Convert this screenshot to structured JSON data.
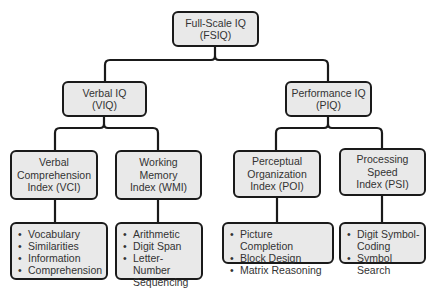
{
  "diagram": {
    "type": "hierarchy",
    "root": {
      "id": "fsiq",
      "label": "Full-Scale IQ\n(FSIQ)"
    },
    "level1": [
      {
        "id": "viq",
        "label": "Verbal IQ\n(VIQ)"
      },
      {
        "id": "piq",
        "label": "Performance IQ\n(PIQ)"
      }
    ],
    "level2": [
      {
        "id": "vci",
        "parent": "viq",
        "label": "Verbal\nComprehension\nIndex (VCI)",
        "subtests": [
          "Vocabulary",
          "Similarities",
          "Information",
          "Comprehension"
        ]
      },
      {
        "id": "wmi",
        "parent": "viq",
        "label": "Working\nMemory\nIndex (WMI)",
        "subtests": [
          "Arithmetic",
          "Digit Span",
          "Letter-Number\nSequencing"
        ]
      },
      {
        "id": "poi",
        "parent": "piq",
        "label": "Perceptual\nOrganization\nIndex (POI)",
        "subtests": [
          "Picture Completion",
          "Block Design",
          "Matrix Reasoning"
        ]
      },
      {
        "id": "psi",
        "parent": "piq",
        "label": "Processing\nSpeed\nIndex (PSI)",
        "subtests": [
          "Digit Symbol-\nCoding",
          "Symbol Search"
        ]
      }
    ],
    "colors": {
      "box_fill": "#e9e9e9",
      "box_border": "#1a1a1a",
      "line": "#1a1a1a",
      "text": "#333333"
    }
  }
}
